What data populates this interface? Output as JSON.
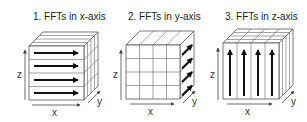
{
  "diagram": {
    "panels": [
      {
        "title": "1. FFTs in x-axis",
        "direction": "x",
        "axis_labels": {
          "x": "x",
          "y": "y",
          "z": "z"
        }
      },
      {
        "title": "2. FFTs in y-axis",
        "direction": "y",
        "axis_labels": {
          "x": "x",
          "y": "y",
          "z": "z"
        }
      },
      {
        "title": "3. FFTs in z-axis",
        "direction": "z",
        "axis_labels": {
          "x": "x",
          "y": "y",
          "z": "z"
        }
      }
    ],
    "grid_divisions": 4,
    "colors": {
      "lines": "#555555",
      "arrows": "#111111",
      "background": "#ffffff"
    }
  }
}
